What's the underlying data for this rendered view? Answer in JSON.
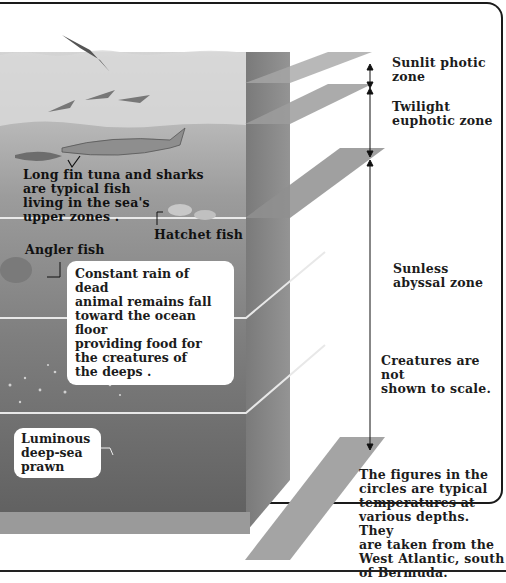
{
  "diagram": {
    "zones": [
      {
        "id": "sunlit",
        "label": "Sunlit photic\nzone"
      },
      {
        "id": "twilight",
        "label": "Twilight\neuphotic zone"
      },
      {
        "id": "sunless",
        "label": "Sunless\nabyssal zone"
      }
    ],
    "notes": {
      "scale": "Creatures are not\nshown to scale.",
      "temperatures": "The figures in the\ncircles are typical\ntemperatures at\nvarious depths. They\nare taken from the\nWest Atlantic, south\nof Bermuda."
    },
    "creatures": {
      "tuna_sharks": "Long fin tuna and sharks\nare typical fish\nliving in the sea's\nupper zones .",
      "hatchet": "Hatchet fish",
      "angler": "Angler fish",
      "rain": "Constant rain of dead\nanimal remains fall\ntoward the ocean floor\nproviding food for\nthe creatures of\nthe deeps .",
      "prawn": "Luminous\ndeep-sea\nprawn"
    },
    "colors": {
      "sky": "#ffffff",
      "surface_water": "#c9c9c9",
      "upper_water": "#a9a9a9",
      "mid_water": "#8a8a8a",
      "deep_water": "#6e6e6e",
      "floor": "#5a5a5a",
      "plane": "#9a9a9a",
      "text": "#1c1c1c"
    }
  }
}
